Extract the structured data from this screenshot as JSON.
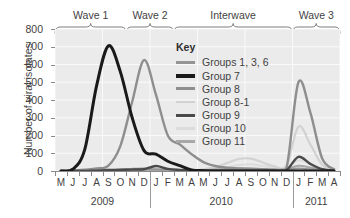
{
  "chart_data": {
    "type": "line",
    "title": "",
    "xlabel": "",
    "ylabel": "Number of viral isolates",
    "ylim": [
      0,
      800
    ],
    "yticks": [
      0,
      100,
      200,
      300,
      400,
      500,
      600,
      700,
      800
    ],
    "grid": true,
    "legend_position": "inside-top-center",
    "legend_title": "Key",
    "x_tick_labels": [
      "M",
      "J",
      "J",
      "A",
      "S",
      "O",
      "N",
      "D",
      "J",
      "F",
      "M",
      "A",
      "M",
      "J",
      "J",
      "A",
      "S",
      "O",
      "N",
      "D",
      "J",
      "F",
      "M",
      "A"
    ],
    "x_months_full": [
      "May 2009",
      "Jun 2009",
      "Jul 2009",
      "Aug 2009",
      "Sep 2009",
      "Oct 2009",
      "Nov 2009",
      "Dec 2009",
      "Jan 2010",
      "Feb 2010",
      "Mar 2010",
      "Apr 2010",
      "May 2010",
      "Jun 2010",
      "Jul 2010",
      "Aug 2010",
      "Sep 2010",
      "Oct 2010",
      "Nov 2010",
      "Dec 2010",
      "Jan 2011",
      "Feb 2011",
      "Mar 2011",
      "Apr 2011"
    ],
    "year_groups": [
      {
        "label": "2009",
        "start_index": 0,
        "end_index": 7
      },
      {
        "label": "2010",
        "start_index": 8,
        "end_index": 19
      },
      {
        "label": "2011",
        "start_index": 20,
        "end_index": 23
      }
    ],
    "wave_annotations": [
      {
        "label": "Wave 1",
        "start_index": 0,
        "end_index": 5
      },
      {
        "label": "Wave 2",
        "start_index": 6,
        "end_index": 9
      },
      {
        "label": "Interwave",
        "start_index": 10,
        "end_index": 19
      },
      {
        "label": "Wave 3",
        "start_index": 20,
        "end_index": 23
      }
    ],
    "series": [
      {
        "name": "Groups 1, 3, 6",
        "color": "#949494",
        "width": 2.0,
        "values": [
          0,
          2,
          4,
          6,
          8,
          10,
          12,
          14,
          10,
          8,
          6,
          6,
          6,
          8,
          10,
          12,
          10,
          8,
          6,
          8,
          14,
          10,
          6,
          2
        ]
      },
      {
        "name": "Group 7",
        "color": "#1a1a1a",
        "width": 3.0,
        "values": [
          0,
          10,
          120,
          480,
          705,
          560,
          300,
          115,
          95,
          55,
          30,
          6,
          2,
          0,
          0,
          0,
          0,
          0,
          0,
          0,
          0,
          0,
          0,
          0
        ]
      },
      {
        "name": "Group 8",
        "color": "#8e8e8e",
        "width": 2.4,
        "values": [
          0,
          3,
          8,
          14,
          30,
          140,
          390,
          625,
          430,
          200,
          150,
          95,
          50,
          28,
          18,
          14,
          12,
          10,
          8,
          20,
          500,
          330,
          70,
          10
        ]
      },
      {
        "name": "Group 8-1",
        "color": "#d2d2d2",
        "width": 2.2,
        "values": [
          0,
          0,
          0,
          0,
          0,
          0,
          0,
          0,
          0,
          0,
          0,
          4,
          10,
          22,
          45,
          68,
          70,
          48,
          26,
          30,
          250,
          150,
          35,
          6
        ]
      },
      {
        "name": "Group 9",
        "color": "#4a4a4a",
        "width": 2.4,
        "values": [
          0,
          0,
          0,
          2,
          4,
          6,
          8,
          10,
          28,
          12,
          6,
          3,
          2,
          2,
          2,
          2,
          2,
          2,
          2,
          6,
          80,
          40,
          10,
          2
        ]
      },
      {
        "name": "Group 10",
        "color": "#dcdcdc",
        "width": 2.0,
        "values": [
          0,
          0,
          0,
          0,
          2,
          4,
          6,
          8,
          8,
          6,
          5,
          5,
          6,
          10,
          20,
          34,
          38,
          28,
          16,
          18,
          60,
          40,
          14,
          4
        ]
      },
      {
        "name": "Group 11",
        "color": "#a8a8a8",
        "width": 2.0,
        "values": [
          0,
          0,
          0,
          0,
          0,
          2,
          4,
          6,
          6,
          5,
          4,
          4,
          5,
          6,
          8,
          12,
          14,
          10,
          8,
          10,
          30,
          20,
          8,
          2
        ]
      }
    ]
  },
  "axis": {
    "y_title": "Number of viral isolates",
    "y_tick_labels": [
      "800",
      "700",
      "600",
      "500",
      "400",
      "300",
      "200",
      "100",
      "0"
    ]
  },
  "legend": {
    "title": "Key",
    "entries": [
      {
        "label": "Groups 1, 3, 6",
        "color": "#949494",
        "thickness": "2.5px"
      },
      {
        "label": "Group 7",
        "color": "#1a1a1a",
        "thickness": "4px"
      },
      {
        "label": "Group 8",
        "color": "#8e8e8e",
        "thickness": "3px"
      },
      {
        "label": "Group 8-1",
        "color": "#d2d2d2",
        "thickness": "2.5px"
      },
      {
        "label": "Group 9",
        "color": "#4a4a4a",
        "thickness": "3.5px"
      },
      {
        "label": "Group 10",
        "color": "#dcdcdc",
        "thickness": "2.5px"
      },
      {
        "label": "Group 11",
        "color": "#a8a8a8",
        "thickness": "2.5px"
      }
    ]
  },
  "colors": {
    "panel_background": "#ebebeb",
    "grid": "#fafafa",
    "axis": "#8a8a8a",
    "text": "#3f3f3f",
    "page_background": "#ffffff"
  }
}
